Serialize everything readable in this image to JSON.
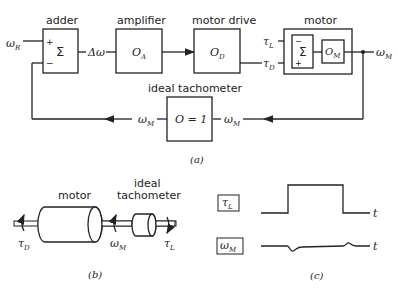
{
  "part_a": {
    "caption": "(a)",
    "input_label": "ω",
    "input_sub": "R",
    "adder": {
      "title": "adder",
      "symbol": "Σ",
      "plus": "+",
      "minus": "−"
    },
    "error_label": "Δω",
    "amplifier": {
      "title": "amplifier",
      "symbol": "O",
      "sub": "A"
    },
    "motor_drive": {
      "title": "motor drive",
      "symbol": "O",
      "sub": "D"
    },
    "motor": {
      "title": "motor",
      "sum_symbol": "Σ",
      "minus": "−",
      "plus": "+",
      "block_symbol": "O",
      "block_sub": "M"
    },
    "load_torque": {
      "sym": "τ",
      "sub": "L"
    },
    "drive_torque": {
      "sym": "τ",
      "sub": "D"
    },
    "output_label": {
      "sym": "ω",
      "sub": "M"
    },
    "tachometer": {
      "title": "ideal tachometer",
      "equation": "O = 1",
      "in_sym": "ω",
      "in_sub": "M",
      "out_sym": "ω",
      "out_sub": "M"
    }
  },
  "part_b": {
    "caption": "(b)",
    "motor_label": "motor",
    "tach_label_1": "ideal",
    "tach_label_2": "tachometer",
    "tau_d": {
      "sym": "τ",
      "sub": "D"
    },
    "omega_m": {
      "sym": "ω",
      "sub": "M"
    },
    "tau_l": {
      "sym": "τ",
      "sub": "L"
    }
  },
  "part_c": {
    "caption": "(c)",
    "signal_1": {
      "sym": "τ",
      "sub": "L",
      "axis": "t"
    },
    "signal_2": {
      "sym": "ω",
      "sub": "M",
      "axis": "t"
    }
  }
}
